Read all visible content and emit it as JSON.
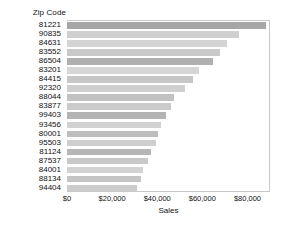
{
  "chart_data": {
    "type": "bar",
    "orientation": "horizontal",
    "title": "",
    "xlabel": "Sales",
    "ylabel": "Zip Code",
    "axis_header": "Zip Code",
    "xlim": [
      0,
      90000
    ],
    "xticks": [
      "$0",
      "$20,000",
      "$40,000",
      "$60,000",
      "$80,000"
    ],
    "xtick_values": [
      0,
      20000,
      40000,
      60000,
      80000
    ],
    "grid": false,
    "legend": "none",
    "categories": [
      "81221",
      "90835",
      "84631",
      "83552",
      "86504",
      "83201",
      "84415",
      "92320",
      "88044",
      "83877",
      "99403",
      "93456",
      "80001",
      "95503",
      "81124",
      "87537",
      "84001",
      "88134",
      "94404"
    ],
    "values": [
      88200,
      76400,
      71000,
      67900,
      64800,
      58600,
      55900,
      52500,
      47600,
      46000,
      43700,
      41800,
      40200,
      39500,
      37100,
      35700,
      33900,
      32800,
      31200
    ],
    "bar_colors": [
      "#a6a6a6",
      "#cfcfcf",
      "#d4d4d4",
      "#c9c9c9",
      "#b0b0b0",
      "#d6d6d6",
      "#c7c7c7",
      "#cfcfcf",
      "#c2c2c2",
      "#cbcbcb",
      "#b4b4b4",
      "#d2d2d2",
      "#bdbdbd",
      "#cfcfcf",
      "#b6b6b6",
      "#c9c9c9",
      "#d2d2d2",
      "#c4c4c4",
      "#cccccc"
    ]
  },
  "colors": {
    "plot_border": "#c8c8c8",
    "text": "#111111",
    "background": "#ffffff"
  }
}
